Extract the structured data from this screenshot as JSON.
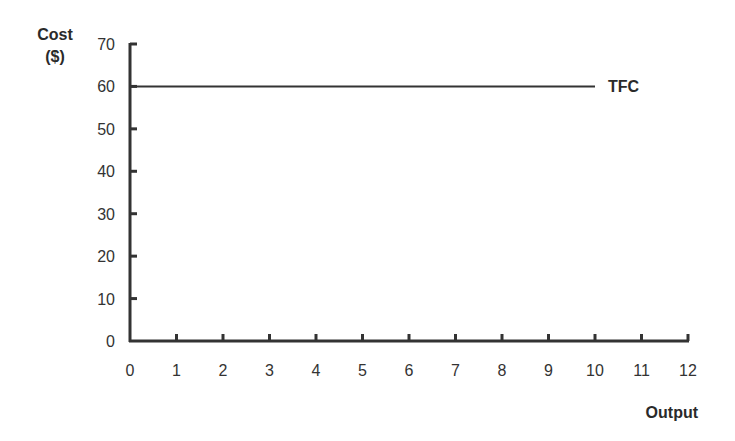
{
  "chart_data": {
    "type": "line",
    "title": "",
    "xlabel": "Output",
    "ylabel": "Cost ($)",
    "ylabel_lines": [
      "Cost",
      "($)"
    ],
    "xlim": [
      0,
      12
    ],
    "ylim": [
      0,
      70
    ],
    "x_ticks": [
      "0",
      "1",
      "2",
      "3",
      "4",
      "5",
      "6",
      "7",
      "8",
      "9",
      "10",
      "11",
      "12"
    ],
    "y_ticks": [
      "0",
      "10",
      "20",
      "30",
      "40",
      "50",
      "60",
      "70"
    ],
    "grid": false,
    "legend": "none",
    "series": [
      {
        "name": "TFC",
        "label": "TFC",
        "x": [
          0,
          10
        ],
        "values": [
          60,
          60
        ],
        "color": "#333333"
      }
    ]
  }
}
